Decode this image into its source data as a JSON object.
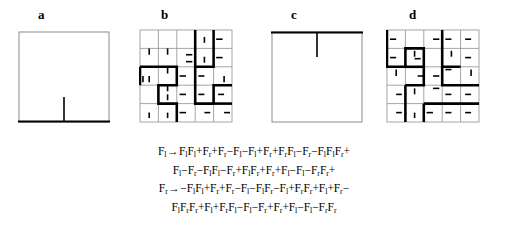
{
  "figure": {
    "background": "#ffffff",
    "stroke_thin": "#8c8c8c",
    "stroke_thick": "#000000"
  },
  "panels": [
    {
      "id": "a",
      "label": "a",
      "kind": "initiator-bottom",
      "description": "Empty square with thick bottom edge and a vertical tick rising from bottom-center"
    },
    {
      "id": "b",
      "label": "b",
      "kind": "curve-stage-1-bottom",
      "description": "5x5 grid of thin cells overlaid with a thick self-avoiding folded curve"
    },
    {
      "id": "c",
      "label": "c",
      "kind": "initiator-top",
      "description": "Empty square with thick top edge and a vertical tick descending from top-center"
    },
    {
      "id": "d",
      "label": "d",
      "kind": "curve-stage-1-top",
      "description": "5x5 grid of thin cells overlaid with a thick self-avoiding folded curve"
    }
  ],
  "formula": {
    "lines": [
      {
        "id": "line-1",
        "tokens": [
          {
            "t": "F",
            "sub": "l"
          },
          {
            "t": "→"
          },
          {
            "t": "F",
            "sub": "l"
          },
          {
            "t": "F",
            "sub": "l"
          },
          {
            "t": "+"
          },
          {
            "t": "F",
            "sub": "r"
          },
          {
            "t": "+"
          },
          {
            "t": "F",
            "sub": "r"
          },
          {
            "t": "−"
          },
          {
            "t": "F",
            "sub": "l"
          },
          {
            "t": "−"
          },
          {
            "t": "F",
            "sub": "l"
          },
          {
            "t": "+"
          },
          {
            "t": "F",
            "sub": "r"
          },
          {
            "t": "+"
          },
          {
            "t": "F",
            "sub": "r"
          },
          {
            "t": "F",
            "sub": "l"
          },
          {
            "t": "−"
          },
          {
            "t": "F",
            "sub": "r"
          },
          {
            "t": "−"
          },
          {
            "t": "F",
            "sub": "l"
          },
          {
            "t": "F",
            "sub": "l"
          },
          {
            "t": "F",
            "sub": "r"
          },
          {
            "t": "+"
          }
        ]
      },
      {
        "id": "line-2",
        "tokens": [
          {
            "t": "F",
            "sub": "l"
          },
          {
            "t": "−"
          },
          {
            "t": "F",
            "sub": "r"
          },
          {
            "t": "−"
          },
          {
            "t": "F",
            "sub": "l"
          },
          {
            "t": "F",
            "sub": "l"
          },
          {
            "t": "−"
          },
          {
            "t": "F",
            "sub": "r"
          },
          {
            "t": "+"
          },
          {
            "t": "F",
            "sub": "l"
          },
          {
            "t": "F",
            "sub": "r"
          },
          {
            "t": "+"
          },
          {
            "t": "F",
            "sub": "r"
          },
          {
            "t": "+"
          },
          {
            "t": "F",
            "sub": "l"
          },
          {
            "t": "−"
          },
          {
            "t": "F",
            "sub": "l"
          },
          {
            "t": "−"
          },
          {
            "t": "F",
            "sub": "r"
          },
          {
            "t": "F",
            "sub": "r"
          },
          {
            "t": "+"
          }
        ]
      },
      {
        "id": "line-3",
        "tokens": [
          {
            "t": "F",
            "sub": "r"
          },
          {
            "t": "→"
          },
          {
            "t": "−"
          },
          {
            "t": "F",
            "sub": "l"
          },
          {
            "t": "F",
            "sub": "l"
          },
          {
            "t": "+"
          },
          {
            "t": "F",
            "sub": "r"
          },
          {
            "t": "+"
          },
          {
            "t": "F",
            "sub": "r"
          },
          {
            "t": "−"
          },
          {
            "t": "F",
            "sub": "l"
          },
          {
            "t": "−"
          },
          {
            "t": "F",
            "sub": "l"
          },
          {
            "t": "F",
            "sub": "r"
          },
          {
            "t": "−"
          },
          {
            "t": "F",
            "sub": "l"
          },
          {
            "t": "+"
          },
          {
            "t": "F",
            "sub": "r"
          },
          {
            "t": "F",
            "sub": "r"
          },
          {
            "t": "+"
          },
          {
            "t": "F",
            "sub": "l"
          },
          {
            "t": "+"
          },
          {
            "t": "F",
            "sub": "r"
          },
          {
            "t": "−"
          }
        ]
      },
      {
        "id": "line-4",
        "tokens": [
          {
            "t": "F",
            "sub": "l"
          },
          {
            "t": "F",
            "sub": "r"
          },
          {
            "t": "F",
            "sub": "r"
          },
          {
            "t": "+"
          },
          {
            "t": "F",
            "sub": "l"
          },
          {
            "t": "+"
          },
          {
            "t": "F",
            "sub": "r"
          },
          {
            "t": "F",
            "sub": "l"
          },
          {
            "t": "−"
          },
          {
            "t": "F",
            "sub": "l"
          },
          {
            "t": "−"
          },
          {
            "t": "F",
            "sub": "r"
          },
          {
            "t": "+"
          },
          {
            "t": "F",
            "sub": "r"
          },
          {
            "t": "+"
          },
          {
            "t": "F",
            "sub": "l"
          },
          {
            "t": "−"
          },
          {
            "t": "F",
            "sub": "l"
          },
          {
            "t": "−"
          },
          {
            "t": "F",
            "sub": "r"
          },
          {
            "t": "F",
            "sub": "r"
          }
        ]
      }
    ]
  },
  "geometry": {
    "panel_a": {
      "x": 18,
      "y": 31,
      "w": 92,
      "h": 92
    },
    "panel_b": {
      "x": 139,
      "y": 29,
      "w": 94,
      "h": 94
    },
    "panel_c": {
      "x": 271,
      "y": 31,
      "w": 92,
      "h": 92
    },
    "panel_d": {
      "x": 386,
      "y": 29,
      "w": 94,
      "h": 94
    },
    "labels": [
      {
        "id": "a",
        "x": 38,
        "y": 10
      },
      {
        "id": "b",
        "x": 161,
        "y": 10
      },
      {
        "id": "c",
        "x": 291,
        "y": 10
      },
      {
        "id": "d",
        "x": 409,
        "y": 10
      }
    ]
  }
}
